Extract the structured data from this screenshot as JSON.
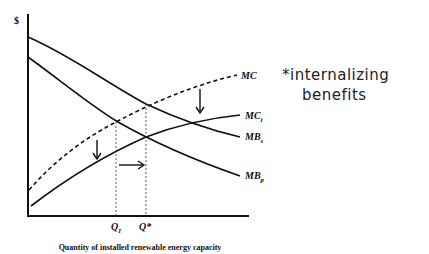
{
  "diagram": {
    "y_axis_label": "$",
    "x_axis_label": "Quantity of installed renewable energy capacity",
    "curves": [
      {
        "id": "MC",
        "label": "MC",
        "subscript": "",
        "style": "dashed"
      },
      {
        "id": "MCi",
        "label": "MC",
        "subscript": "i",
        "style": "solid"
      },
      {
        "id": "MBs",
        "label": "MB",
        "subscript": "s",
        "style": "solid"
      },
      {
        "id": "MBp",
        "label": "MB",
        "subscript": "p",
        "style": "solid"
      }
    ],
    "x_ticks": [
      {
        "label": "Q",
        "subscript": "I"
      },
      {
        "label": "Q*",
        "subscript": ""
      }
    ],
    "arrows": [
      "down-shift-MC",
      "down-shift-MC-left",
      "right-shift-Q"
    ],
    "annotation": {
      "line1": "*internalizing",
      "line2": "benefits"
    }
  }
}
